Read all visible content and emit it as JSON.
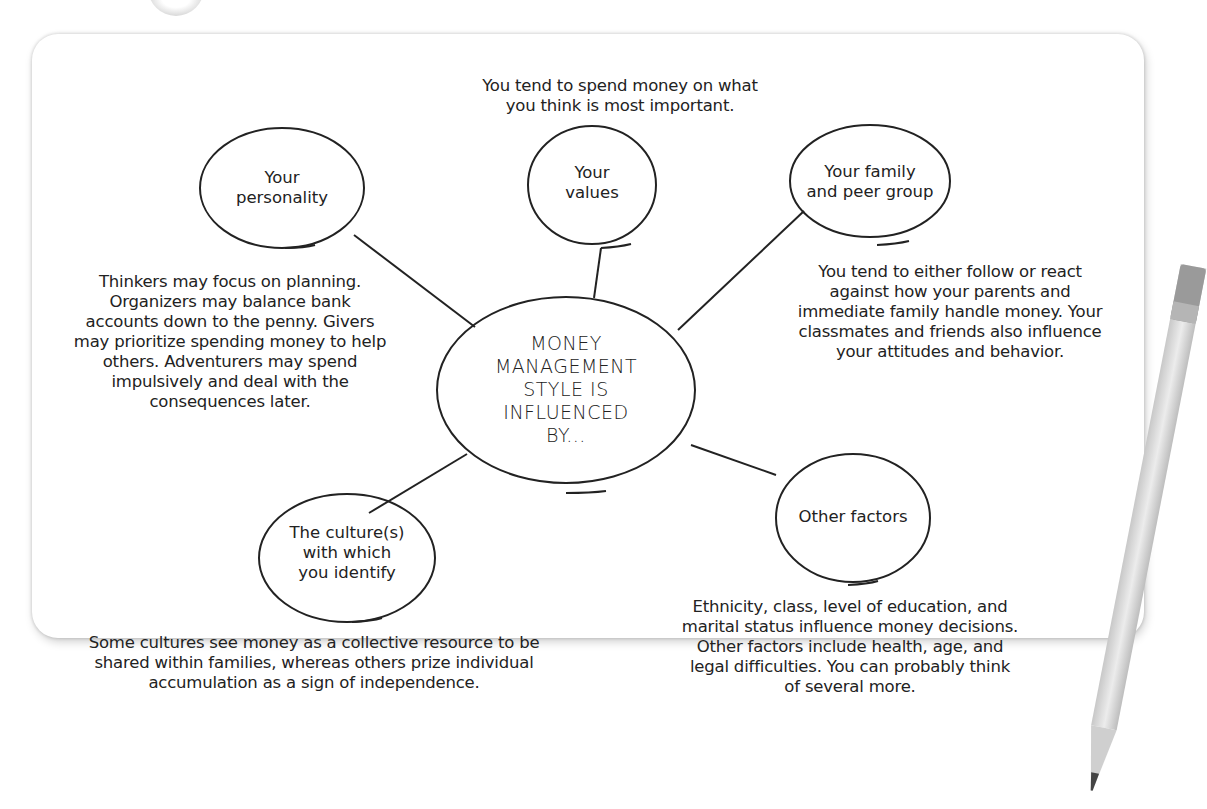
{
  "diagram": {
    "center": {
      "label": "MONEY\nMANAGEMENT\nSTYLE IS\nINFLUENCED\nBY..."
    },
    "nodes": [
      {
        "id": "personality",
        "label": "Your\npersonality",
        "description": "Thinkers may focus on planning.\nOrganizers may balance bank\naccounts down to the penny. Givers\nmay prioritize spending money to help\nothers. Adventurers may spend\nimpulsively and deal with the\nconsequences later."
      },
      {
        "id": "values",
        "label": "Your\nvalues",
        "description": "You tend to spend money on what\nyou think is most important."
      },
      {
        "id": "family",
        "label": "Your family\nand peer group",
        "description": "You tend to either follow or react\nagainst how your parents and\nimmediate family handle money. Your\nclassmates and friends also influence\nyour attitudes and behavior."
      },
      {
        "id": "culture",
        "label": "The culture(s)\nwith which\nyou identify",
        "description": "Some cultures see money as a collective resource to be\nshared within families, whereas others prize individual\naccumulation as a sign of independence."
      },
      {
        "id": "other",
        "label": "Other factors",
        "description": "Ethnicity, class, level of education, and\nmarital status influence money decisions.\nOther factors include health, age, and\nlegal difficulties. You can probably think\nof several more."
      }
    ]
  },
  "decorations": {
    "pencil": "pencil-icon",
    "paper_clip": "clip-icon"
  },
  "colors": {
    "ink": "#222222",
    "card_background": "#ffffff",
    "card_shadow": "#bdbdbd",
    "pencil_body": "#d8d8d8"
  }
}
